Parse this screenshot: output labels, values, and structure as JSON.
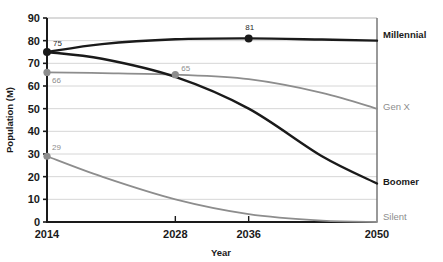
{
  "chart_data": {
    "type": "line",
    "title": "",
    "xlabel": "Year",
    "ylabel": "Population (M)",
    "xlim": [
      2014,
      2050
    ],
    "ylim": [
      0,
      90
    ],
    "xticks": [
      "2014",
      "2028",
      "2036",
      "2050"
    ],
    "xtick_values": [
      2014,
      2028,
      2036,
      2050
    ],
    "yticks": [
      "0",
      "10",
      "20",
      "30",
      "40",
      "50",
      "60",
      "70",
      "80",
      "90"
    ],
    "ytick_values": [
      0,
      10,
      20,
      30,
      40,
      50,
      60,
      70,
      80,
      90
    ],
    "grid": true,
    "grid_axis": "y",
    "legend_position": "right-inline",
    "x": [
      2014,
      2020,
      2028,
      2036,
      2044,
      2050
    ],
    "series": [
      {
        "name": "Millennial",
        "color": "#1a1a1a",
        "style": "bold-dark",
        "values": [
          75,
          78.5,
          80.6,
          81,
          80.5,
          80
        ]
      },
      {
        "name": "Gen X",
        "color": "#8d8d8d",
        "style": "gray",
        "values": [
          66,
          65.7,
          65,
          63,
          57,
          50
        ]
      },
      {
        "name": "Boomer",
        "color": "#1a1a1a",
        "style": "bold-dark",
        "values": [
          75,
          72,
          64,
          50,
          29,
          17
        ]
      },
      {
        "name": "Silent",
        "color": "#8d8d8d",
        "style": "gray",
        "values": [
          29,
          20,
          10,
          3.5,
          0.6,
          0
        ]
      }
    ],
    "annotations": [
      {
        "label": "75",
        "series": "Millennial",
        "x": 2014,
        "y": 75,
        "marker": true,
        "color": "dark"
      },
      {
        "label": "81",
        "series": "Millennial",
        "x": 2036,
        "y": 81,
        "marker": true,
        "color": "dark"
      },
      {
        "label": "66",
        "series": "Gen X",
        "x": 2014,
        "y": 66,
        "marker": true,
        "color": "gray"
      },
      {
        "label": "65",
        "series": "Gen X",
        "x": 2028,
        "y": 65,
        "marker": true,
        "color": "gray"
      },
      {
        "label": "29",
        "series": "Silent",
        "x": 2014,
        "y": 29,
        "marker": true,
        "color": "gray"
      }
    ],
    "colors": {
      "dark": "#1a1a1a",
      "gray": "#8d8d8d",
      "grid": "#d6d6d6",
      "axis": "#1a1a1a",
      "background": "#ffffff"
    }
  }
}
